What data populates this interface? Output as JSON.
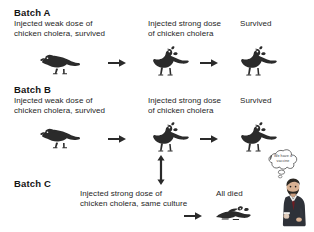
{
  "diagram": {
    "title_context": "Pasteur chicken cholera vaccination experiment",
    "batches": [
      {
        "id": "A",
        "label": "Batch A",
        "steps": [
          {
            "caption": "Injected weak dose of\nchicken cholera, survived",
            "icon": "chicken-crouching-icon"
          },
          {
            "caption": "Injected strong dose\nof chicken cholera",
            "icon": "chicken-standing-icon"
          },
          {
            "caption": "Survived",
            "icon": "chicken-standing-icon"
          }
        ],
        "connectors": [
          "arrow-right-icon",
          "arrow-right-icon"
        ]
      },
      {
        "id": "B",
        "label": "Batch B",
        "steps": [
          {
            "caption": "Injected weak dose of\nchicken cholera, survived",
            "icon": "chicken-crouching-icon"
          },
          {
            "caption": "Injected strong dose\nof chicken cholera",
            "icon": "chicken-standing-icon"
          },
          {
            "caption": "Survived",
            "icon": "chicken-standing-icon"
          }
        ],
        "connectors": [
          "arrow-right-icon",
          "arrow-right-icon"
        ]
      },
      {
        "id": "C",
        "label": "Batch C",
        "steps": [
          {
            "caption": "Injected strong dose of\nchicken cholera, same culture",
            "icon": "none"
          },
          {
            "caption": "All died",
            "icon": "chicken-dead-icon"
          }
        ],
        "connectors": [
          "arrow-right-icon"
        ]
      }
    ],
    "vertical_connector": {
      "icon": "arrow-updown-icon"
    },
    "thought_bubble": {
      "text": "We have a\nvaccine",
      "icon": "thought-bubble-icon"
    },
    "scientist": {
      "icon": "scientist-figure-icon"
    },
    "colors": {
      "ink": "#1b1b1b",
      "caption": "#262626",
      "arrow": "#2a2a2a",
      "chicken": "#2b2b2b",
      "suit": "#2e3138",
      "background": "#ffffff"
    }
  }
}
